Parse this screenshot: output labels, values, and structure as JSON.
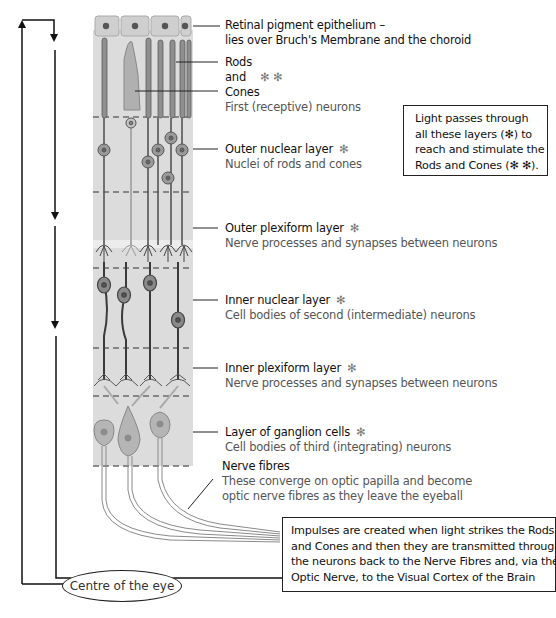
{
  "layers": [
    {
      "id": "rpe",
      "title": "Retinal pigment epithelium –",
      "subtitle": "lies over Bruch's Membrane and the choroid",
      "marker": ""
    },
    {
      "id": "rods-cones",
      "title_lines": [
        "Rods",
        "and",
        "Cones"
      ],
      "marker": "✻ ✻",
      "subtitle": "First (receptive) neurons"
    },
    {
      "id": "outer-nuclear",
      "title": "Outer nuclear layer",
      "marker": "✻",
      "subtitle": "Nuclei of rods and cones"
    },
    {
      "id": "outer-plexiform",
      "title": "Outer plexiform layer",
      "marker": "✻",
      "subtitle": "Nerve processes and synapses between neurons"
    },
    {
      "id": "inner-nuclear",
      "title": "Inner nuclear layer",
      "marker": "✻",
      "subtitle": "Cell bodies of second (intermediate) neurons"
    },
    {
      "id": "inner-plexiform",
      "title": "Inner plexiform layer",
      "marker": "✻",
      "subtitle": "Nerve processes and synapses between neurons"
    },
    {
      "id": "ganglion",
      "title": "Layer of ganglion cells",
      "marker": "✻",
      "subtitle": "Cell bodies of third (integrating) neurons"
    },
    {
      "id": "nerve-fibres",
      "title": "Nerve fibres",
      "marker": "",
      "subtitle_lines": [
        "These converge on optic papilla and become",
        "optic nerve fibres as they leave the eyeball"
      ]
    }
  ],
  "light_box": {
    "lines": [
      "Light passes through",
      "all these layers (✻) to",
      "reach and stimulate the",
      "Rods and Cones (✻ ✻)."
    ]
  },
  "impulse_box": {
    "lines": [
      "Impulses are created when light strikes the Rods",
      "and Cones and then they are transmitted through",
      "the neurons back to the Nerve Fibres and, via the",
      "Optic Nerve, to the Visual Cortex of the Brain"
    ]
  },
  "centre_label": "Centre of the eye",
  "colors": {
    "tissue": "#d9d9d9",
    "cell_fill": "#9a9a9a",
    "cell_stroke": "#4a4a4a",
    "light_cell": "#b8b8b8",
    "dark_neuron": "#3a3a3a",
    "dashed": "#6b6b6b",
    "arrow": "#111111"
  }
}
